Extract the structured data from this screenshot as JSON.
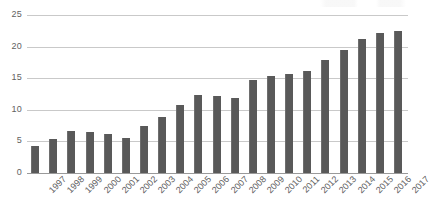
{
  "chart_data": {
    "type": "bar",
    "title": "",
    "subtitle": "",
    "xlabel": "",
    "ylabel": "",
    "categories": [
      "1997",
      "1998",
      "1999",
      "2000",
      "2001",
      "2002",
      "2003",
      "2004",
      "2005",
      "2006",
      "2007",
      "2008",
      "2009",
      "2010",
      "2011",
      "2012",
      "2013",
      "2014",
      "2015",
      "2016",
      "2017"
    ],
    "values": [
      4.3,
      5.4,
      6.7,
      6.5,
      6.2,
      5.6,
      7.4,
      8.8,
      10.8,
      12.4,
      12.2,
      11.9,
      14.7,
      15.3,
      15.7,
      16.1,
      17.9,
      19.5,
      21.2,
      22.1,
      22.4
    ],
    "series": [
      {
        "name": "",
        "values": [
          4.3,
          5.4,
          6.7,
          6.5,
          6.2,
          5.6,
          7.4,
          8.8,
          10.8,
          12.4,
          12.2,
          11.9,
          14.7,
          15.3,
          15.7,
          16.1,
          17.9,
          19.5,
          21.2,
          22.1,
          22.4
        ]
      }
    ],
    "ylim": [
      0,
      25
    ],
    "yticks": [
      0,
      5,
      10,
      15,
      20,
      25
    ],
    "ytick_labels": [
      "0",
      "5",
      "10",
      "15",
      "20",
      "25"
    ],
    "grid": true,
    "grid_axis": "y",
    "legend": false,
    "legend_position": "none",
    "bar_color": "#595959",
    "grid_color": "#c9c9c9",
    "axis_color": "#9a9a9a",
    "background_color": "#ffffff",
    "tick_label_rotation": -45,
    "annotations": []
  }
}
